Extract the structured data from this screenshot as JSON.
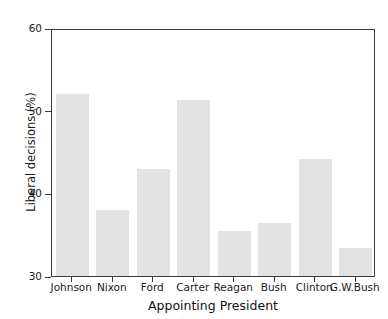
{
  "chart_data": {
    "type": "bar",
    "title": "",
    "xlabel": "Appointing President",
    "ylabel": "Liberal decisions (%)",
    "categories": [
      "Johnson",
      "Nixon",
      "Ford",
      "Carter",
      "Reagan",
      "Bush",
      "Clinton",
      "G.W.Bush"
    ],
    "values": [
      52.0,
      38.0,
      43.0,
      51.3,
      35.4,
      36.4,
      44.2,
      33.4
    ],
    "ylim": [
      30,
      60
    ],
    "yticks": [
      30,
      40,
      50,
      60
    ],
    "ytick_labels": [
      "30",
      "40",
      "50",
      "60"
    ],
    "grid": false,
    "legend": null,
    "bar_color": "#e3e3e3",
    "axis_color": "#3a3a3a",
    "text_color": "#1a1a1a"
  },
  "figure": {
    "top_remnant": "",
    "background": "#ffffff"
  }
}
